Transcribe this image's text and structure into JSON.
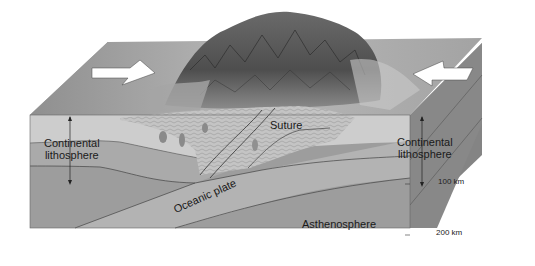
{
  "diagram": {
    "labels": {
      "continental_lithosphere_left_line1": "Continental",
      "continental_lithosphere_left_line2": "lithosphere",
      "continental_lithosphere_right_line1": "Continental",
      "continental_lithosphere_right_line2": "lithosphere",
      "suture": "Suture",
      "oceanic_plate": "Oceanic plate",
      "asthenosphere": "Asthenosphere",
      "depth_100": "100 km",
      "depth_200": "200 km"
    },
    "arrows": [
      {
        "name": "left-plate-motion-arrow",
        "direction": "right"
      },
      {
        "name": "right-plate-motion-arrow",
        "direction": "left"
      }
    ],
    "colors": {
      "background": "#ffffff",
      "top_surface": "#9a9a9a",
      "crust_light": "#c9c9c9",
      "lithosphere_mid": "#a9a9a9",
      "asthenosphere": "#9d9d9d",
      "side_face_top": "#8e8e8e",
      "side_face_bottom": "#7c7c7c",
      "mountain_dark": "#4a4a4a",
      "arrow_fill": "#ffffff"
    }
  }
}
